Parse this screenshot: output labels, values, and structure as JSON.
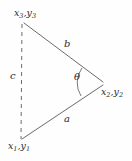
{
  "figure": {
    "type": "geometry-diagram",
    "background_color": "#fefefe",
    "line_color": "#6b6b6b",
    "text_color": "#2b2b2b"
  },
  "vertices": [
    {
      "id": "v3",
      "name": "top-left-vertex",
      "label_main_1": "x",
      "label_sub_1": "3",
      "label_comma": ",",
      "label_main_2": "y",
      "label_sub_2": "3",
      "label_text": "x3,y3",
      "x": 23,
      "y": 23
    },
    {
      "id": "v1",
      "name": "bottom-left-vertex",
      "label_main_1": "x",
      "label_sub_1": "1",
      "label_comma": ",",
      "label_main_2": "y",
      "label_sub_2": "1",
      "label_text": "x1,y1",
      "x": 21,
      "y": 140
    },
    {
      "id": "v2",
      "name": "right-vertex",
      "label_main_1": "x",
      "label_sub_1": "2",
      "label_comma": ",",
      "label_main_2": "y",
      "label_sub_2": "2",
      "label_text": "x2,y2",
      "x": 103,
      "y": 83
    }
  ],
  "sides": [
    {
      "id": "b",
      "name": "side-b",
      "label": "b",
      "style": "solid",
      "from": "v3",
      "to": "v2"
    },
    {
      "id": "a",
      "name": "side-a",
      "label": "a",
      "style": "solid",
      "from": "v1",
      "to": "v2"
    },
    {
      "id": "c",
      "name": "side-c",
      "label": "c",
      "style": "dashed",
      "from": "v3",
      "to": "v1"
    }
  ],
  "angle": {
    "id": "theta",
    "name": "angle-theta",
    "label": "θ",
    "at_vertex": "v2",
    "between_sides": [
      "a",
      "b"
    ]
  }
}
